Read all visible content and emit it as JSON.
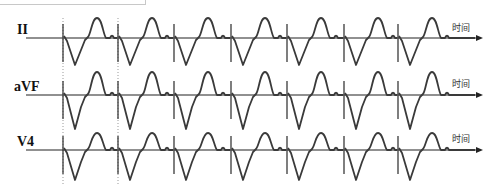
{
  "figure": {
    "type": "ecg_strip",
    "leads": [
      {
        "label": "II",
        "baseline_y": 38,
        "label_x": 17,
        "label_y": 24
      },
      {
        "label": "aVF",
        "baseline_y": 95,
        "label_x": 14,
        "label_y": 81
      },
      {
        "label": "V4",
        "baseline_y": 150,
        "label_x": 17,
        "label_y": 136
      }
    ],
    "axis_label": "时间",
    "pacing_spike_x": [
      63,
      118,
      174,
      231,
      287,
      344,
      398
    ],
    "dotted_markers_x": [
      63,
      118
    ],
    "colors": {
      "trace": "#3a3a3a",
      "axis": "#222222",
      "marker": "#999999"
    }
  }
}
